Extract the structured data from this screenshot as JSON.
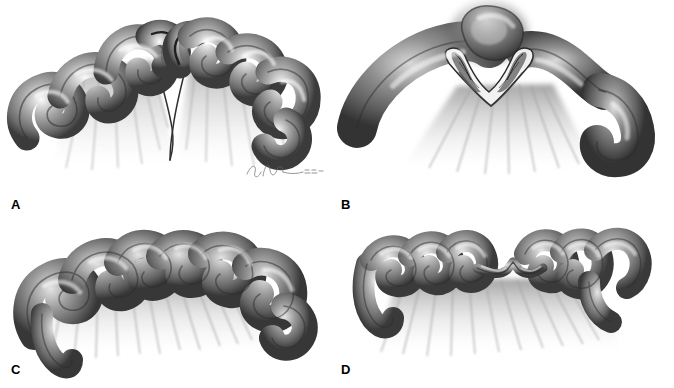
{
  "figure": {
    "style": "grayscale graphite medical illustration",
    "background_color": "#ffffff",
    "layout": "2x2 grid of four untitled panels, no borders or dividers",
    "panel_count": 4
  },
  "colors": {
    "background": "#ffffff",
    "outline_dark": "#2f2f2f",
    "bowel_mid": "#8b8b8b",
    "bowel_shadow": "#4a4a4a",
    "bowel_highlight": "#f2f2f2",
    "mesentery_gray": "#b8b8b8",
    "label_text": "#000000",
    "signature": "#6a6a6a"
  },
  "panels": [
    {
      "id": "a",
      "label": "A",
      "subject": "intestinal-atresia-type-IIIa",
      "description": "Two blind-ending bowel limbs separated by a V-shaped mesenteric defect",
      "signature_present": true
    },
    {
      "id": "b",
      "label": "B",
      "subject": "intestinal-atresia-type-I",
      "description": "Continuous bowel with cutaway showing an intraluminal membrane or web",
      "signature_present": true
    },
    {
      "id": "c",
      "label": "C",
      "subject": "intestinal-atresia-continuous-bowel",
      "description": "Continuous coiled bowel loops over an intact fan-shaped mesentery",
      "signature_present": true
    },
    {
      "id": "d",
      "label": "D",
      "subject": "intestinal-atresia-type-II",
      "description": "Two bowel segments joined by a thin fibrous cord with intact mesentery",
      "signature_present": true
    }
  ],
  "signature": {
    "name": "artist-signature",
    "legible_text": "",
    "note": "cursive handwritten signature, not legible"
  }
}
